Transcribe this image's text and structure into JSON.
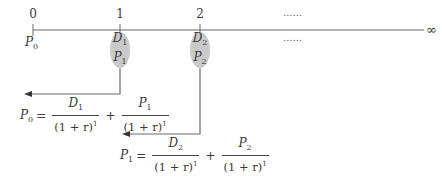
{
  "timeline": {
    "periods": [
      "0",
      "1",
      "2"
    ],
    "ellipsis_top": "......",
    "ellipsis_bottom": "......",
    "infinity": "∞",
    "start_label": {
      "var": "P",
      "sub": "0"
    },
    "line_color": "#6b6b6b",
    "ellipse_color": "#c9c9c9"
  },
  "cashflows": [
    {
      "period": "1",
      "dividend": {
        "var": "D",
        "sub": "1"
      },
      "price": {
        "var": "P",
        "sub": "1"
      }
    },
    {
      "period": "2",
      "dividend": {
        "var": "D",
        "sub": "2"
      },
      "price": {
        "var": "P",
        "sub": "2"
      }
    }
  ],
  "formulas": [
    {
      "lhs": {
        "var": "P",
        "sub": "0"
      },
      "equals": "=",
      "plus": "+",
      "term1": {
        "num_var": "D",
        "num_sub": "1",
        "den": "(1 + r)",
        "den_exp": "1"
      },
      "term2": {
        "num_var": "P",
        "num_sub": "1",
        "den": "(1 + r)",
        "den_exp": "1"
      }
    },
    {
      "lhs": {
        "var": "P",
        "sub": "1"
      },
      "equals": "=",
      "plus": "+",
      "term1": {
        "num_var": "D",
        "num_sub": "2",
        "den": "(1 + r)",
        "den_exp": "1"
      },
      "term2": {
        "num_var": "P",
        "num_sub": "2",
        "den": "(1 + r)",
        "den_exp": "1"
      }
    }
  ]
}
